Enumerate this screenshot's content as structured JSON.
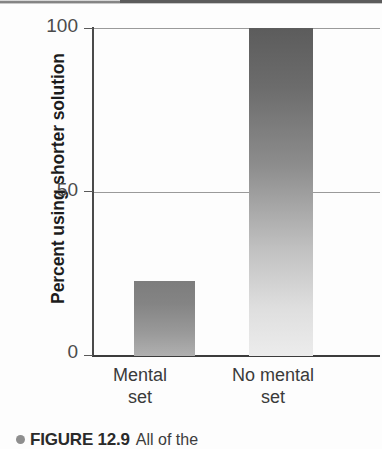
{
  "figure": {
    "caption_bullet": "●",
    "caption_title": "FIGURE 12.9",
    "caption_text": "All of the",
    "colors": {
      "bar_mental_set_top": "#7d7d7d",
      "bar_mental_set_bottom": "#b0b0b0",
      "bar_no_mental_set_top": "#5c5c5c",
      "bar_no_mental_set_bottom": "#ececec",
      "axis": "#3c3c3c",
      "gridline": "#9a9a9a",
      "text": "#1c1c1c"
    }
  },
  "chart_data": {
    "type": "bar",
    "title": "",
    "xlabel": "",
    "ylabel": "Percent using shorter solution",
    "categories": [
      "Mental set",
      "No mental set"
    ],
    "category_lines": [
      [
        "Mental",
        "set"
      ],
      [
        "No mental",
        "set"
      ]
    ],
    "values": [
      23,
      100
    ],
    "ylim": [
      0,
      100
    ],
    "yticks": [
      0,
      50,
      100
    ],
    "ytick_labels": [
      "0",
      "50",
      "100"
    ],
    "grid": true,
    "grid_axis": "y",
    "legend": false
  }
}
